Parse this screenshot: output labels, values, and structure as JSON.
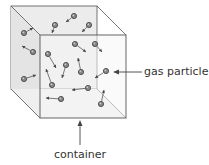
{
  "diagram": {
    "labels": {
      "gas_particle": "gas particle",
      "container": "container"
    },
    "colors": {
      "edge": "#555555",
      "face_back": "#ececec",
      "face_front": "#f6f6f6",
      "particle_fill": "#8a8a8a",
      "particle_stroke": "#3a3a3a",
      "arrow": "#444444"
    },
    "cube": {
      "back": {
        "x1": 11,
        "y1": 6,
        "x2": 97,
        "y2": 89
      },
      "front": {
        "x1": 40,
        "y1": 35,
        "x2": 126,
        "y2": 118
      }
    },
    "particles": [
      {
        "cx": 24,
        "cy": 33,
        "dx": 33,
        "dy": 28
      },
      {
        "cx": 55,
        "cy": 25,
        "dx": 52,
        "dy": 33
      },
      {
        "cx": 74,
        "cy": 16,
        "dx": 66,
        "dy": 22
      },
      {
        "cx": 89,
        "cy": 25,
        "dx": 82,
        "dy": 32
      },
      {
        "cx": 33,
        "cy": 52,
        "dx": 22,
        "dy": 46
      },
      {
        "cx": 48,
        "cy": 54,
        "dx": 56,
        "dy": 68
      },
      {
        "cx": 75,
        "cy": 44,
        "dx": 86,
        "dy": 52
      },
      {
        "cx": 95,
        "cy": 44,
        "dx": 102,
        "dy": 52
      },
      {
        "cx": 66,
        "cy": 65,
        "dx": 62,
        "dy": 78
      },
      {
        "cx": 81,
        "cy": 72,
        "dx": 78,
        "dy": 58
      },
      {
        "cx": 24,
        "cy": 79,
        "dx": 36,
        "dy": 75
      },
      {
        "cx": 52,
        "cy": 85,
        "dx": 46,
        "dy": 69
      },
      {
        "cx": 106,
        "cy": 71,
        "dx": 95,
        "dy": 78
      },
      {
        "cx": 88,
        "cy": 88,
        "dx": 72,
        "dy": 90
      },
      {
        "cx": 61,
        "cy": 99,
        "dx": 46,
        "dy": 98
      },
      {
        "cx": 101,
        "cy": 104,
        "dx": 104,
        "dy": 90
      }
    ]
  }
}
